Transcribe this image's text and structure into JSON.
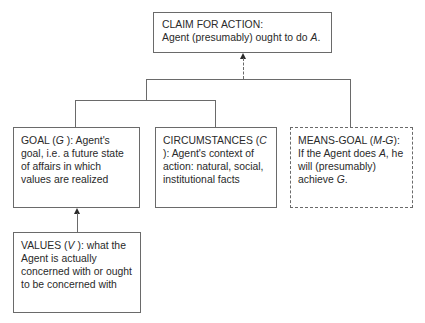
{
  "diagram": {
    "claim": {
      "title": "CLAIM FOR ACTION:",
      "body_prefix": "Agent (presumably) ought to do ",
      "body_var": "A",
      "body_suffix": "."
    },
    "goal": {
      "label": "GOAL (",
      "var": "G",
      "rest": " ): Agent's goal, i.e.  a future state of affairs in which values are realized"
    },
    "circumstances": {
      "label": "CIRCUMSTANCES (",
      "var": "C",
      "rest": " ): Agent's context of action: natural, social, institutional facts"
    },
    "means_goal": {
      "label": "MEANS-GOAL (",
      "var": "M-G",
      "rest_1": "): If the Agent does ",
      "var_a": "A",
      "rest_2": ", he will (presumably) achieve ",
      "var_g": "G",
      "rest_3": "."
    },
    "values": {
      "label": "VALUES (",
      "var": "V",
      "rest": " ): what the Agent is actually concerned with or ought to be concerned with"
    },
    "edges": [
      {
        "from": "goal+circumstances",
        "to": "claim",
        "style": "solid-then-dashed-arrow"
      },
      {
        "from": "means_goal",
        "to": "claim",
        "style": "solid-joined"
      },
      {
        "from": "values",
        "to": "goal",
        "style": "solid-arrow"
      }
    ],
    "colors": {
      "line": "#6a6a6a",
      "text": "#2a2a2a",
      "background": "#ffffff"
    }
  }
}
